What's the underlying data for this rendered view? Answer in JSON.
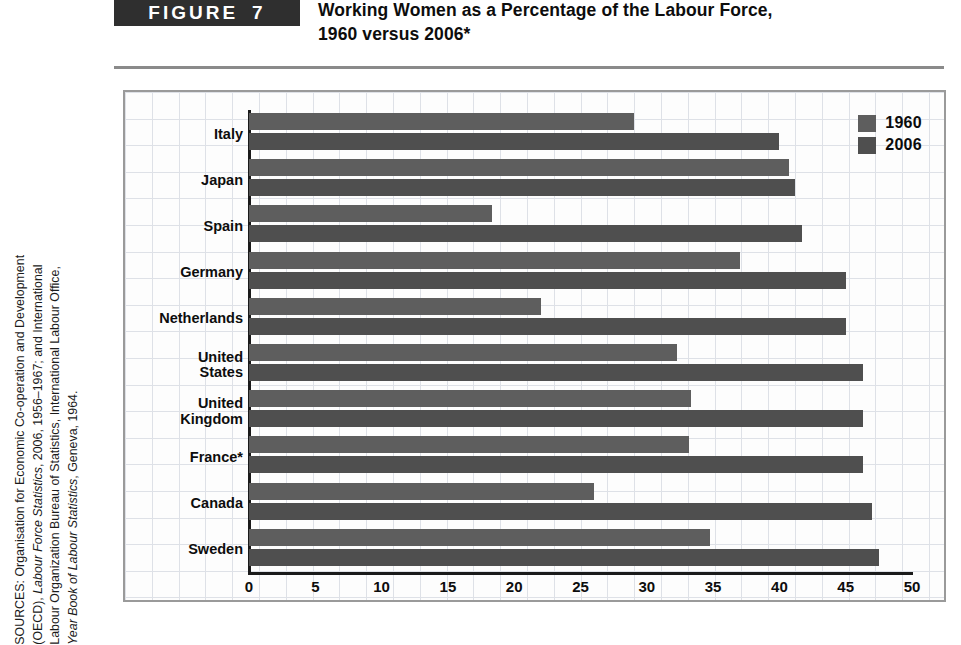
{
  "figure": {
    "badge_word": "FIGURE",
    "badge_number": "7",
    "title_line1": "Working Women as a Percentage of the Labour Force,",
    "title_line2": "1960 versus 2006*"
  },
  "source_note": {
    "line1": "SOURCES: Organisation for Economic Co-operation and Development",
    "line2_plain_a": "(OECD), ",
    "line2_italic": "Labour Force Statistics",
    "line2_plain_b": ", 2006, 1956–1967; and International",
    "line3": "Labour Organization Bureau of Statistics, International Labour Office,",
    "line4_italic": "Year Book of Labour Statistics",
    "line4_plain": ", Geneva, 1964."
  },
  "colors": {
    "bar_1960": "#5e5e5e",
    "bar_2006": "#4f4f4f",
    "badge_bg": "#2f2f2f",
    "grid": "#d9dde4",
    "axis": "#1a1a1a"
  },
  "chart_data": {
    "type": "bar",
    "orientation": "horizontal",
    "title": "Working Women as a Percentage of the Labour Force, 1960 versus 2006*",
    "xlabel": "",
    "ylabel": "",
    "xlim": [
      0,
      50
    ],
    "xticks": [
      "0",
      "5",
      "10",
      "15",
      "20",
      "25",
      "30",
      "35",
      "40",
      "45",
      "50"
    ],
    "grid": true,
    "legend_position": "top-right",
    "categories": [
      "Italy",
      "Japan",
      "Spain",
      "Germany",
      "Netherlands",
      "United\nStates",
      "United\nKingdom",
      "France*",
      "Canada",
      "Sweden"
    ],
    "series": [
      {
        "name": "1960",
        "values": [
          29.0,
          40.7,
          18.3,
          37.0,
          22.0,
          32.3,
          33.3,
          33.2,
          26.0,
          34.8
        ]
      },
      {
        "name": "2006",
        "values": [
          40.0,
          41.2,
          41.7,
          45.0,
          45.0,
          46.3,
          46.3,
          46.3,
          47.0,
          47.5
        ]
      }
    ]
  }
}
